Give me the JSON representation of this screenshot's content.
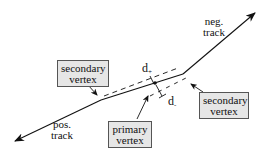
{
  "diagram": {
    "type": "vertex-track-geometry",
    "labels": {
      "neg_track": [
        "neg.",
        "track"
      ],
      "pos_track": [
        "pos.",
        "track"
      ],
      "secondary_vertex_left": [
        "secondary",
        "vertex"
      ],
      "secondary_vertex_right": [
        "secondary",
        "vertex"
      ],
      "primary_vertex": [
        "primary",
        "vertex"
      ],
      "d_plus": {
        "base": "d",
        "sub": "+"
      },
      "d_minus": {
        "base": "d",
        "sub": "-"
      }
    },
    "colors": {
      "line": "#111111",
      "box_fill": "#e6e6e6",
      "box_border": "#555555",
      "background": "#ffffff"
    }
  }
}
